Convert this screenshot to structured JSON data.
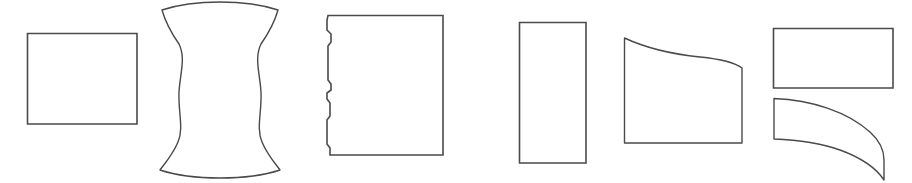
{
  "figure": {
    "background_color": "#ffffff",
    "stroke_color": "#4a4a4a",
    "fill_color": "#ffffff",
    "width": 912,
    "height": 183,
    "shape_count": 7
  },
  "shapes": [
    {
      "id": "shape-1",
      "name": "plain-rectangle",
      "label": "Rectangle",
      "description": "Plain horizontal rectangle with straight edges and square corners",
      "bounds": {
        "x": 27,
        "y": 33,
        "width": 110,
        "height": 91
      },
      "path": "M 27.5 33.5 L 137 33.5 L 137 124 L 27.5 124 Z"
    },
    {
      "id": "shape-2",
      "name": "hourglass-spool",
      "label": "Concave spool",
      "description": "Hourglass or spool form with concave curved sides and flared rounded top and bottom caps",
      "bounds": {
        "x": 153,
        "y": 6,
        "width": 134,
        "height": 170
      },
      "path": "M 162 10 C 166 24 172 34 179 44 C 186 58 180 74 179 92 C 178 112 184 128 178 142 C 173 154 166 162 160 170 C 178 176 200 178 220 178 C 240 178 262 176 280 170 C 274 162 267 154 262 142 C 256 128 262 112 261 92 C 260 74 254 58 261 44 C 268 34 274 24 278 10 C 260 4 240 2 220 2 C 200 2 180 4 162 10 Z"
    },
    {
      "id": "shape-3",
      "name": "jagged-left-edge-rectangle",
      "label": "Rectangle with stepped left edge",
      "description": "Rectangle whose left edge has several small notch and step irregularities",
      "bounds": {
        "x": 328,
        "y": 15,
        "width": 115,
        "height": 140
      },
      "path": "M 328 15.5 L 443 15.5 L 443 155 L 330 155 L 330 148 L 327 144 L 327 120 L 330 116 L 330 103 L 327 99 L 327 93 L 331 90 L 331 84 L 328 80 L 328 46 L 331 42 L 331 34 L 327 30 L 327 20 L 328 15.5 Z"
    },
    {
      "id": "shape-4",
      "name": "tall-narrow-rectangle",
      "label": "Tall rectangle",
      "description": "Narrow vertical rectangle, taller than it is wide",
      "bounds": {
        "x": 519,
        "y": 22,
        "width": 67,
        "height": 141
      },
      "path": "M 519.5 22.5 L 586 22.5 L 586 163 L 519.5 163 Z"
    },
    {
      "id": "shape-5",
      "name": "sagging-top-rectangle",
      "label": "Rectangle with curved top",
      "description": "Quadrilateral with flat bottom and sides, and a top edge that dips in a shallow sagging curve from the high left corner to the lower right corner",
      "bounds": {
        "x": 624,
        "y": 38,
        "width": 118,
        "height": 105
      },
      "path": "M 624.5 38 C 646 48 670 54 700 57 C 720 59 734 62 742 68 L 742 143 L 624.5 143 Z"
    },
    {
      "id": "shape-6",
      "name": "wide-flat-rectangle",
      "label": "Wide flat rectangle",
      "description": "Short wide rectangle positioned in the upper right",
      "bounds": {
        "x": 773,
        "y": 28,
        "width": 120,
        "height": 60
      },
      "path": "M 773.5 28.5 L 893 28.5 L 893 88 L 773.5 88 Z"
    },
    {
      "id": "shape-7",
      "name": "curved-band",
      "label": "Curved band",
      "description": "Arc-shaped band with a straight vertical left edge, top and bottom edges sweeping rightward and downward, and a short vertical right edge",
      "bounds": {
        "x": 773,
        "y": 98,
        "width": 120,
        "height": 82
      },
      "path": "M 774 98.5 C 812 100 848 112 870 132 C 880 141 884 150 884 160 L 884 180 C 876 168 862 158 840 150 C 820 143 798 140 774 139 Z"
    }
  ]
}
